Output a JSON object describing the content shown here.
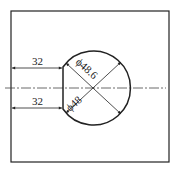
{
  "drawing": {
    "type": "technical-drawing",
    "frame": {
      "x": 11,
      "y": 11,
      "width": 158,
      "height": 151
    },
    "circle": {
      "cx": 95,
      "cy": 88,
      "r": 37
    },
    "flat_chord_x": 63,
    "centerline_y": 88,
    "dimensions": {
      "top_width": "32",
      "bottom_width": "32",
      "outer_diameter": "ϕ48.6",
      "inner_diameter": "ϕ48"
    },
    "colors": {
      "line": "#222222",
      "centerline": "#444444",
      "background": "#ffffff"
    }
  }
}
